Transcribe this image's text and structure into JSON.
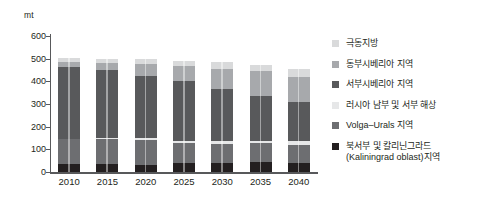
{
  "chart_data": {
    "type": "bar",
    "stacked": true,
    "title": "",
    "subtitle": "",
    "xlabel": "",
    "ylabel": "mt",
    "unit_label": "mt",
    "ylim": [
      0,
      600
    ],
    "ytick_step": 100,
    "ytick_labels": [
      "600",
      "500",
      "400",
      "300",
      "200",
      "100",
      "0"
    ],
    "ytick_values": [
      600,
      500,
      400,
      300,
      200,
      100,
      0
    ],
    "grid": false,
    "legend_position": "right",
    "categories": [
      "2010",
      "2015",
      "2020",
      "2025",
      "2030",
      "2035",
      "2040"
    ],
    "series": [
      {
        "name": "북서부 및 칼리닌그라드\n(Kaliningrad oblast)지역",
        "color": "#231f20",
        "values": [
          35,
          35,
          33,
          40,
          40,
          42,
          40
        ]
      },
      {
        "name": "Volga–Urals 지역",
        "color": "#6d6e71",
        "values": [
          110,
          112,
          110,
          90,
          85,
          85,
          80
        ]
      },
      {
        "name": "러시아 남부 및 서부 해상",
        "color": "#e6e7e8",
        "values": [
          2,
          3,
          5,
          8,
          10,
          12,
          15
        ]
      },
      {
        "name": "서부시베리아 지역",
        "color": "#58595b",
        "values": [
          318,
          302,
          275,
          265,
          230,
          195,
          175
        ]
      },
      {
        "name": "동부시베리아 지역",
        "color": "#a7a9ac",
        "values": [
          20,
          30,
          55,
          65,
          90,
          110,
          110
        ]
      },
      {
        "name": "극동지방",
        "color": "#d9dadb",
        "values": [
          18,
          18,
          19,
          24,
          32,
          28,
          35
        ]
      }
    ],
    "totals": [
      503,
      500,
      497,
      492,
      487,
      472,
      455
    ],
    "legend": [
      {
        "label": "극동지방",
        "color": "#d9dadb"
      },
      {
        "label": "동부시베리아 지역",
        "color": "#a7a9ac"
      },
      {
        "label": "서부시베리아 지역",
        "color": "#58595b"
      },
      {
        "label": "러시아 남부 및 서부 해상",
        "color": "#e6e7e8"
      },
      {
        "label": "Volga–Urals 지역",
        "color": "#6d6e71"
      },
      {
        "label": "북서부 및 칼리닌그라드\n(Kaliningrad oblast)지역",
        "color": "#231f20"
      }
    ]
  },
  "axis": {
    "color": "#58595b"
  }
}
